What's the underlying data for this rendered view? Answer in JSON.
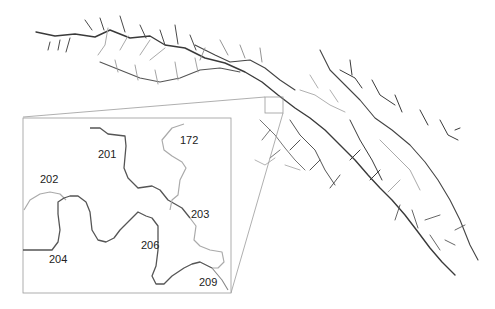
{
  "figure": {
    "type": "river network map with zoomed inset",
    "colors": {
      "background": "#ffffff",
      "dark_stream": "#3a3a3a",
      "light_stream": "#b0b0b0",
      "inset_frame": "#9a9a9a"
    }
  },
  "inset": {
    "reach_labels": [
      {
        "id": "172",
        "x": 178,
        "y": 135
      },
      {
        "id": "201",
        "x": 98,
        "y": 149
      },
      {
        "id": "202",
        "x": 40,
        "y": 174
      },
      {
        "id": "203",
        "x": 191,
        "y": 209
      },
      {
        "id": "204",
        "x": 48,
        "y": 254
      },
      {
        "id": "206",
        "x": 140,
        "y": 240
      },
      {
        "id": "209",
        "x": 198,
        "y": 276
      }
    ]
  }
}
